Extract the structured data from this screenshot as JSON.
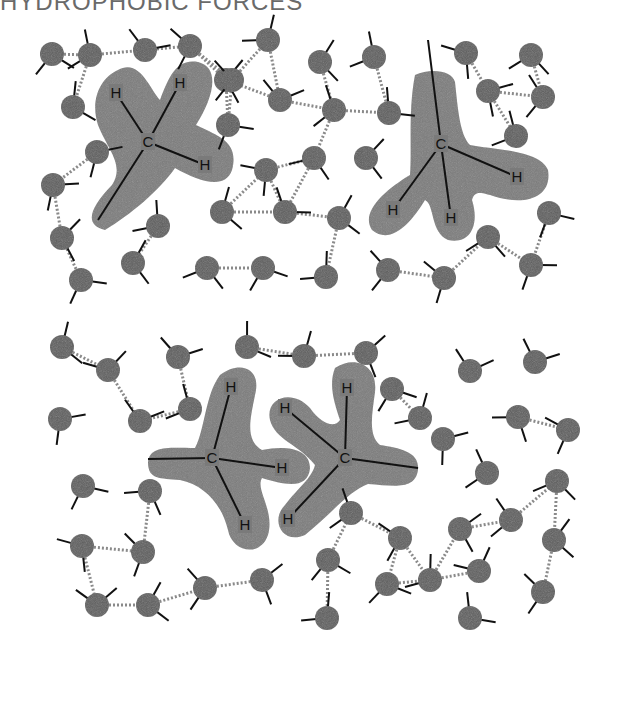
{
  "title": "HYDROPHOBIC FORCES",
  "colors": {
    "water_oxygen": "#5c5c5c",
    "methane_cloud": "#7a7a7a",
    "bond": "#111111",
    "hbond": "#8a8a8a",
    "label": "#111111",
    "title": "#6a6a6a"
  },
  "panels": [
    {
      "name": "separated-methanes",
      "methanes": [
        {
          "carbon": {
            "label": "C",
            "x": 148,
            "y": 142
          },
          "hydrogens": [
            {
              "label": "H",
              "x": 116,
              "y": 93
            },
            {
              "label": "H",
              "x": 180,
              "y": 83
            },
            {
              "label": "H",
              "x": 205,
              "y": 165
            }
          ],
          "tail": {
            "x": 98,
            "y": 220
          },
          "cloud": "M118,70 C140,58 150,90 160,100 C168,80 175,58 198,62 C222,68 212,100 196,125 C215,135 240,140 232,170 C225,190 200,182 175,168 C160,190 130,215 105,230 C85,225 88,210 112,185 C125,165 108,150 98,125 C90,100 100,78 118,70 Z"
        },
        {
          "carbon": {
            "label": "C",
            "x": 441,
            "y": 144
          },
          "hydrogens": [
            {
              "label": "H",
              "x": 393,
              "y": 210
            },
            {
              "label": "H",
              "x": 451,
              "y": 218
            },
            {
              "label": "H",
              "x": 517,
              "y": 177
            }
          ],
          "tail": {
            "x": 428,
            "y": 40
          },
          "cloud": "M415,75 C430,68 452,70 455,82 C458,110 460,135 470,145 C495,150 540,150 548,170 C552,195 530,205 500,198 C480,192 475,190 472,200 C480,225 470,245 448,240 C430,232 435,205 425,200 C410,225 390,245 372,230 C360,212 385,190 410,175 C412,150 408,110 415,75 Z"
        }
      ],
      "waters": [
        {
          "x": 52,
          "y": 54
        },
        {
          "x": 90,
          "y": 55
        },
        {
          "x": 145,
          "y": 50
        },
        {
          "x": 190,
          "y": 46
        },
        {
          "x": 268,
          "y": 40
        },
        {
          "x": 320,
          "y": 62
        },
        {
          "x": 374,
          "y": 57
        },
        {
          "x": 466,
          "y": 53
        },
        {
          "x": 531,
          "y": 55
        },
        {
          "x": 73,
          "y": 107
        },
        {
          "x": 97,
          "y": 152
        },
        {
          "x": 226,
          "y": 80
        },
        {
          "x": 280,
          "y": 100
        },
        {
          "x": 228,
          "y": 125
        },
        {
          "x": 232,
          "y": 80
        },
        {
          "x": 334,
          "y": 110
        },
        {
          "x": 389,
          "y": 113
        },
        {
          "x": 488,
          "y": 91
        },
        {
          "x": 543,
          "y": 97
        },
        {
          "x": 516,
          "y": 136
        },
        {
          "x": 53,
          "y": 185
        },
        {
          "x": 62,
          "y": 238
        },
        {
          "x": 158,
          "y": 226
        },
        {
          "x": 222,
          "y": 212
        },
        {
          "x": 266,
          "y": 170
        },
        {
          "x": 314,
          "y": 158
        },
        {
          "x": 285,
          "y": 212
        },
        {
          "x": 366,
          "y": 158
        },
        {
          "x": 339,
          "y": 218
        },
        {
          "x": 549,
          "y": 213
        },
        {
          "x": 81,
          "y": 280
        },
        {
          "x": 133,
          "y": 263
        },
        {
          "x": 207,
          "y": 268
        },
        {
          "x": 263,
          "y": 268
        },
        {
          "x": 326,
          "y": 277
        },
        {
          "x": 388,
          "y": 270
        },
        {
          "x": 444,
          "y": 278
        },
        {
          "x": 488,
          "y": 237
        },
        {
          "x": 531,
          "y": 265
        }
      ]
    },
    {
      "name": "associated-methanes",
      "methanes": [
        {
          "carbon": {
            "label": "C",
            "x": 212,
            "y": 458
          },
          "hydrogens": [
            {
              "label": "H",
              "x": 231,
              "y": 387
            },
            {
              "label": "H",
              "x": 282,
              "y": 468
            },
            {
              "label": "H",
              "x": 245,
              "y": 525
            }
          ],
          "tail": {
            "x": 148,
            "y": 459
          },
          "cloud": "M220,375 C240,360 262,368 255,395 C250,420 245,440 262,450 C285,445 310,448 310,468 C308,490 285,485 262,478 C255,490 275,510 268,535 C260,558 232,552 228,530 C222,505 205,485 180,480 C160,478 148,480 148,462 C150,445 170,448 195,448 C205,430 205,395 220,375 Z"
        },
        {
          "carbon": {
            "label": "C",
            "x": 345,
            "y": 458
          },
          "hydrogens": [
            {
              "label": "H",
              "x": 347,
              "y": 388
            },
            {
              "label": "H",
              "x": 285,
              "y": 408
            },
            {
              "label": "H",
              "x": 288,
              "y": 519
            }
          ],
          "tail": {
            "x": 418,
            "y": 468
          },
          "cloud": "M335,368 C355,355 378,365 375,392 C372,415 368,435 380,445 C400,448 420,452 418,470 C415,490 395,486 368,484 C350,490 330,515 305,535 C282,545 270,520 285,505 C298,488 312,478 315,465 C300,445 275,440 270,420 C265,398 292,388 310,408 C322,425 335,428 340,420 C335,405 328,385 335,368 Z"
        }
      ],
      "waters": [
        {
          "x": 62,
          "y": 347
        },
        {
          "x": 108,
          "y": 370
        },
        {
          "x": 178,
          "y": 357
        },
        {
          "x": 190,
          "y": 409
        },
        {
          "x": 60,
          "y": 419
        },
        {
          "x": 140,
          "y": 421
        },
        {
          "x": 247,
          "y": 347
        },
        {
          "x": 304,
          "y": 356
        },
        {
          "x": 366,
          "y": 353
        },
        {
          "x": 392,
          "y": 389
        },
        {
          "x": 420,
          "y": 418
        },
        {
          "x": 470,
          "y": 371
        },
        {
          "x": 535,
          "y": 362
        },
        {
          "x": 518,
          "y": 417
        },
        {
          "x": 568,
          "y": 430
        },
        {
          "x": 443,
          "y": 439
        },
        {
          "x": 83,
          "y": 486
        },
        {
          "x": 150,
          "y": 491
        },
        {
          "x": 82,
          "y": 546
        },
        {
          "x": 143,
          "y": 552
        },
        {
          "x": 97,
          "y": 605
        },
        {
          "x": 148,
          "y": 605
        },
        {
          "x": 205,
          "y": 588
        },
        {
          "x": 262,
          "y": 580
        },
        {
          "x": 328,
          "y": 560
        },
        {
          "x": 327,
          "y": 618
        },
        {
          "x": 351,
          "y": 513
        },
        {
          "x": 400,
          "y": 538
        },
        {
          "x": 387,
          "y": 584
        },
        {
          "x": 430,
          "y": 580
        },
        {
          "x": 460,
          "y": 529
        },
        {
          "x": 487,
          "y": 473
        },
        {
          "x": 511,
          "y": 520
        },
        {
          "x": 557,
          "y": 481
        },
        {
          "x": 554,
          "y": 540
        },
        {
          "x": 479,
          "y": 571
        },
        {
          "x": 543,
          "y": 592
        },
        {
          "x": 470,
          "y": 618
        }
      ]
    }
  ]
}
